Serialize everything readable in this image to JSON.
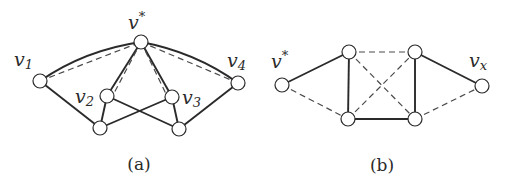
{
  "figure": {
    "panels": [
      {
        "id": "a",
        "caption": "(a)",
        "nodes": [
          {
            "id": "vstar",
            "label_base": "v",
            "label_sup": "*",
            "x": 141,
            "y": 42
          },
          {
            "id": "v1",
            "label_base": "v",
            "label_sub": "1",
            "x": 40,
            "y": 81
          },
          {
            "id": "v2",
            "label_base": "v",
            "label_sub": "2",
            "x": 107,
            "y": 96
          },
          {
            "id": "v3",
            "label_base": "v",
            "label_sub": "3",
            "x": 172,
            "y": 97
          },
          {
            "id": "v4",
            "label_base": "v",
            "label_sub": "4",
            "x": 238,
            "y": 83
          },
          {
            "id": "bl",
            "label_base": "",
            "x": 100,
            "y": 128
          },
          {
            "id": "br",
            "label_base": "",
            "x": 179,
            "y": 129
          }
        ],
        "solid_edges": [
          [
            "v1",
            "vstar",
            "curve"
          ],
          [
            "vstar",
            "v4",
            "curve"
          ],
          [
            "vstar",
            "v2"
          ],
          [
            "vstar",
            "v3"
          ],
          [
            "v1",
            "bl"
          ],
          [
            "v2",
            "bl"
          ],
          [
            "v2",
            "br"
          ],
          [
            "v3",
            "bl"
          ],
          [
            "v3",
            "br"
          ],
          [
            "v4",
            "br"
          ]
        ],
        "dashed_edges": [
          [
            "v1",
            "vstar"
          ],
          [
            "vstar",
            "v2"
          ],
          [
            "vstar",
            "v3"
          ],
          [
            "vstar",
            "v4"
          ]
        ]
      },
      {
        "id": "b",
        "caption": "(b)",
        "nodes": [
          {
            "id": "vstar",
            "label_base": "v",
            "label_sup": "*",
            "x": 282,
            "y": 85
          },
          {
            "id": "tl",
            "label_base": "",
            "x": 349,
            "y": 52
          },
          {
            "id": "bl",
            "label_base": "",
            "x": 348,
            "y": 119
          },
          {
            "id": "tr",
            "label_base": "",
            "x": 415,
            "y": 52
          },
          {
            "id": "br",
            "label_base": "",
            "x": 415,
            "y": 119
          },
          {
            "id": "vx",
            "label_base": "v",
            "label_sub": "x",
            "x": 482,
            "y": 86
          }
        ],
        "solid_edges": [
          [
            "vstar",
            "tl"
          ],
          [
            "tl",
            "bl"
          ],
          [
            "bl",
            "br"
          ],
          [
            "tr",
            "br"
          ],
          [
            "tr",
            "vx"
          ]
        ],
        "dashed_edges": [
          [
            "vstar",
            "bl"
          ],
          [
            "tl",
            "tr"
          ],
          [
            "tl",
            "br"
          ],
          [
            "bl",
            "tr"
          ],
          [
            "br",
            "vx"
          ]
        ]
      }
    ],
    "labels": {
      "a_vstar": {
        "base": "v",
        "sup": "*"
      },
      "a_v1": {
        "base": "v",
        "sub": "1"
      },
      "a_v2": {
        "base": "v",
        "sub": "2"
      },
      "a_v3": {
        "base": "v",
        "sub": "3"
      },
      "a_v4": {
        "base": "v",
        "sub": "4"
      },
      "b_vstar": {
        "base": "v",
        "sup": "*"
      },
      "b_vx": {
        "base": "v",
        "sub": "x"
      }
    },
    "captions": {
      "a": "(a)",
      "b": "(b)"
    },
    "colors": {
      "ink": "#2a2a2a",
      "background": "#ffffff"
    }
  }
}
